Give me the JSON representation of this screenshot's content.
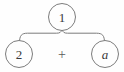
{
  "diagram": {
    "type": "expression-tree",
    "title": "",
    "colors": {
      "stroke": "#7c7c7c",
      "node_fill": "#fefefe",
      "label_text": "#3a3a3a",
      "operator_text": "#5a5a5a",
      "background": "#fefefe"
    },
    "root": {
      "label": "1",
      "style": "upright",
      "cx": 62,
      "cy": 17,
      "r": 14
    },
    "operator": {
      "label": "+",
      "cx": 62,
      "cy": 54
    },
    "children": [
      {
        "label": "2",
        "style": "upright",
        "cx": 19,
        "cy": 54,
        "r": 14
      },
      {
        "label": "a",
        "style": "italic",
        "cx": 105,
        "cy": 54,
        "r": 14
      }
    ],
    "connector": {
      "kind": "horizontal-curly-brace",
      "peak_x": 62,
      "peak_y": 30,
      "arm_y": 33,
      "left_end_x": 19,
      "right_end_x": 105,
      "end_y": 42
    }
  }
}
